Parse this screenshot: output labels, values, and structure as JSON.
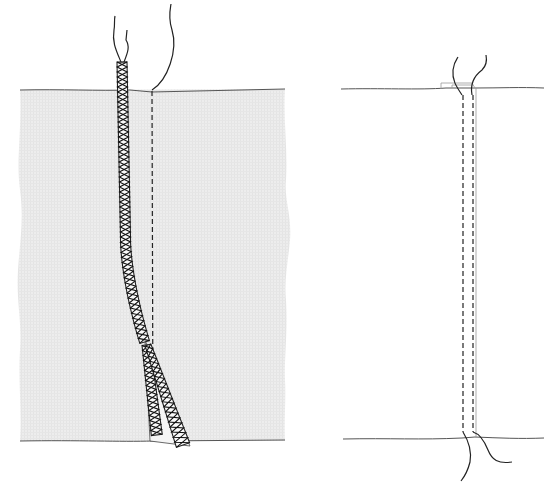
{
  "figure": {
    "title": "",
    "panels": [
      {
        "id": "left",
        "description": "Seam with serged (overlocked) seam allowances pressed together to one side, fabric shaded",
        "fabric_color": "#ececec",
        "elements": [
          "fabric-panel",
          "straight-seam-stitching",
          "serged-seam-allowance",
          "thread-tails-top"
        ]
      },
      {
        "id": "right",
        "description": "Seam shown from right side with double row of topstitching, thread tails at top and bottom",
        "fabric_color": "#ffffff",
        "elements": [
          "fabric-top-edge",
          "fabric-bottom-edge",
          "topstitch-row-left",
          "topstitch-row-right",
          "thread-tails-top",
          "thread-tails-bottom"
        ]
      }
    ],
    "colors": {
      "line": "#222222",
      "edge": "#555555",
      "fabric_fill": "#ececec",
      "background": "#ffffff"
    }
  }
}
